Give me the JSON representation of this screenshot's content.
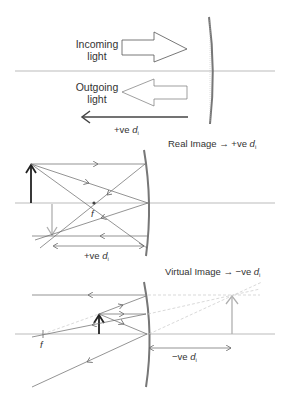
{
  "panel_top": {
    "incoming_label_line1": "Incoming",
    "incoming_label_line2": "light",
    "outgoing_label_line1": "Outgoing",
    "outgoing_label_line2": "light",
    "direction_label_prefix": "+ve ",
    "direction_label_var": "d",
    "direction_label_sub": "i"
  },
  "panel_middle": {
    "title_prefix": "Real Image → +ve ",
    "title_var": "d",
    "title_sub": "i",
    "focal_label": "f",
    "distance_label_prefix": "+ve ",
    "distance_label_var": "d",
    "distance_label_sub": "i"
  },
  "panel_bottom": {
    "title_prefix": "Virtual Image → −ve ",
    "title_var": "d",
    "title_sub": "i",
    "focal_label": "f",
    "distance_label_prefix": "−ve ",
    "distance_label_var": "d",
    "distance_label_sub": "i"
  },
  "colors": {
    "ray": "#666666",
    "axis": "#aaaaaa",
    "mirror": "#777777",
    "object": "#222222",
    "image": "#b0b0b0",
    "virtual_ray": "#c8c8c8"
  }
}
